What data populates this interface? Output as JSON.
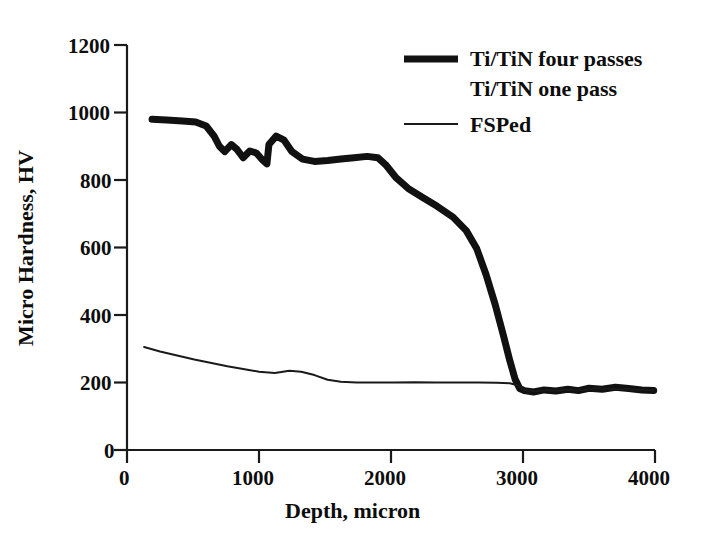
{
  "chart_data": {
    "type": "line",
    "title": "",
    "xlabel": "Depth, micron",
    "ylabel": "Micro Hardness, HV",
    "xlim": [
      0,
      4000
    ],
    "ylim": [
      0,
      1200
    ],
    "xticks": [
      0,
      1000,
      2000,
      3000,
      4000
    ],
    "yticks": [
      0,
      200,
      400,
      600,
      800,
      1000,
      1200
    ],
    "xtick_labels": [
      "0",
      "1000",
      "2000",
      "3000",
      "4000"
    ],
    "ytick_labels": [
      "0",
      "200",
      "400",
      "600",
      "800",
      "1000",
      "1200"
    ],
    "grid": false,
    "legend_position": "upper-right",
    "series": [
      {
        "name": "Ti/TiN four passes",
        "style": "thick-solid",
        "color": "#111111",
        "linewidth": 7,
        "points": [
          [
            190,
            980
          ],
          [
            300,
            978
          ],
          [
            420,
            975
          ],
          [
            520,
            972
          ],
          [
            600,
            960
          ],
          [
            660,
            930
          ],
          [
            700,
            900
          ],
          [
            740,
            884
          ],
          [
            790,
            905
          ],
          [
            830,
            892
          ],
          [
            880,
            866
          ],
          [
            930,
            886
          ],
          [
            980,
            880
          ],
          [
            1020,
            862
          ],
          [
            1060,
            848
          ],
          [
            1075,
            905
          ],
          [
            1130,
            930
          ],
          [
            1190,
            918
          ],
          [
            1250,
            884
          ],
          [
            1330,
            862
          ],
          [
            1420,
            855
          ],
          [
            1520,
            858
          ],
          [
            1620,
            862
          ],
          [
            1720,
            866
          ],
          [
            1820,
            870
          ],
          [
            1900,
            866
          ],
          [
            1960,
            845
          ],
          [
            2040,
            806
          ],
          [
            2130,
            775
          ],
          [
            2240,
            748
          ],
          [
            2350,
            722
          ],
          [
            2470,
            690
          ],
          [
            2570,
            650
          ],
          [
            2650,
            596
          ],
          [
            2720,
            520
          ],
          [
            2790,
            430
          ],
          [
            2850,
            342
          ],
          [
            2900,
            265
          ],
          [
            2940,
            210
          ],
          [
            2975,
            182
          ],
          [
            3010,
            176
          ],
          [
            3080,
            172
          ],
          [
            3160,
            178
          ],
          [
            3250,
            175
          ],
          [
            3340,
            180
          ],
          [
            3420,
            176
          ],
          [
            3500,
            183
          ],
          [
            3600,
            180
          ],
          [
            3700,
            186
          ],
          [
            3800,
            182
          ],
          [
            3900,
            178
          ],
          [
            3990,
            176
          ]
        ]
      },
      {
        "name": "Ti/TiN one pass",
        "style": "none",
        "color": "#111111",
        "linewidth": 0,
        "points": []
      },
      {
        "name": "FSPed",
        "style": "thin-solid",
        "color": "#1a1a1a",
        "linewidth": 2,
        "points": [
          [
            130,
            305
          ],
          [
            250,
            292
          ],
          [
            380,
            280
          ],
          [
            510,
            268
          ],
          [
            640,
            258
          ],
          [
            760,
            248
          ],
          [
            880,
            240
          ],
          [
            1000,
            232
          ],
          [
            1120,
            228
          ],
          [
            1230,
            235
          ],
          [
            1320,
            232
          ],
          [
            1420,
            222
          ],
          [
            1520,
            208
          ],
          [
            1620,
            202
          ],
          [
            1740,
            200
          ],
          [
            1880,
            200
          ],
          [
            2020,
            200
          ],
          [
            2180,
            201
          ],
          [
            2340,
            200
          ],
          [
            2500,
            200
          ],
          [
            2660,
            200
          ],
          [
            2800,
            199
          ],
          [
            2900,
            198
          ],
          [
            2960,
            192
          ],
          [
            3010,
            178
          ],
          [
            3090,
            174
          ],
          [
            3180,
            177
          ],
          [
            3270,
            176
          ],
          [
            3360,
            180
          ],
          [
            3460,
            177
          ],
          [
            3560,
            183
          ],
          [
            3680,
            181
          ],
          [
            3800,
            180
          ],
          [
            3900,
            178
          ],
          [
            3990,
            176
          ]
        ]
      }
    ],
    "legend_entries": [
      {
        "label": "Ti/TiN four passes",
        "marker": "thick-line",
        "color": "#111111"
      },
      {
        "label": "Ti/TiN one pass",
        "marker": "none",
        "color": "#111111"
      },
      {
        "label": "FSPed",
        "marker": "thin-line",
        "color": "#1a1a1a"
      }
    ]
  }
}
